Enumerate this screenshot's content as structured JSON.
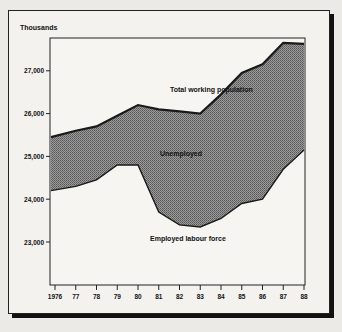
{
  "chart_data": {
    "type": "area",
    "title": "",
    "ylabel": "Thousands",
    "xlabel": "",
    "x": [
      "1976",
      "77",
      "78",
      "79",
      "80",
      "81",
      "82",
      "83",
      "84",
      "85",
      "86",
      "87",
      "88"
    ],
    "ylim": [
      22000,
      28000
    ],
    "yticks": [
      "27,000",
      "26,000",
      "25,000",
      "24,000",
      "23,000"
    ],
    "ytick_values": [
      27000,
      26000,
      25000,
      24000,
      23000
    ],
    "series": [
      {
        "name": "Total working population",
        "values": [
          25450,
          25600,
          25700,
          25950,
          26200,
          26100,
          26050,
          26000,
          26450,
          26950,
          27150,
          27650,
          27630
        ]
      },
      {
        "name": "Employed labour force",
        "values": [
          24200,
          24300,
          24450,
          24800,
          24800,
          23700,
          23400,
          23350,
          23550,
          23900,
          24000,
          24700,
          25150
        ]
      }
    ],
    "annotations": [
      {
        "text": "Total working population"
      },
      {
        "text": "Unemployed"
      },
      {
        "text": "Employed labour force"
      }
    ],
    "grid": false,
    "legend": "none (inline labels)"
  },
  "labels": {
    "y_unit": "Thousands",
    "total": "Total working population",
    "unemployed": "Unemployed",
    "employed": "Employed labour force"
  }
}
